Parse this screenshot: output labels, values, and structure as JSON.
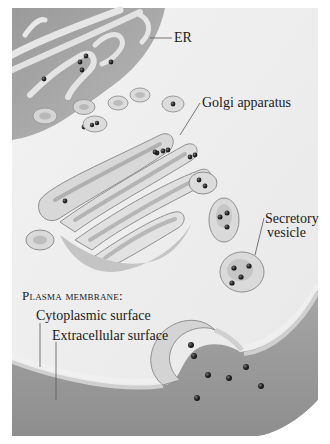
{
  "figure": {
    "palette": {
      "background": "#ffffff",
      "cytoplasm": "#ededed",
      "er_lumen": "#a9a9a9",
      "membrane_light": "#e4e4e4",
      "membrane_mid": "#c9c9c9",
      "membrane_dark": "#8f8f8f",
      "extracellular": "#9c9c9c",
      "cargo": "#2a2a2a",
      "label_text": "#1a1a1a",
      "leader_line": "#555555"
    },
    "labels": {
      "er": "ER",
      "golgi": "Golgi apparatus",
      "secretory_line1": "Secretory",
      "secretory_line2": "vesicle",
      "plasma_membrane_heading": "Plasma membrane:",
      "cytoplasmic_surface": "Cytoplasmic surface",
      "extracellular_surface": "Extracellular surface"
    }
  }
}
